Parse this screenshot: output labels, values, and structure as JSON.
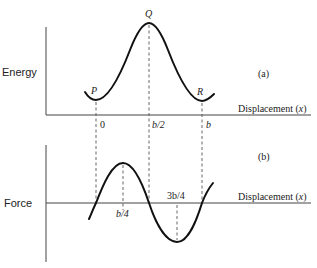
{
  "diagram": {
    "panel_a": {
      "tag": "(a)",
      "y_label": "Energy",
      "x_label": "Displacement (x)",
      "points": [
        {
          "label": "P",
          "x_label": "0"
        },
        {
          "label": "Q",
          "x_label": "b/2"
        },
        {
          "label": "R",
          "x_label": "b"
        }
      ]
    },
    "panel_b": {
      "tag": "(b)",
      "y_label": "Force",
      "x_label": "Displacement (x)",
      "marks": [
        {
          "x_label": "b/4"
        },
        {
          "x_label": "3b/4"
        }
      ]
    }
  }
}
